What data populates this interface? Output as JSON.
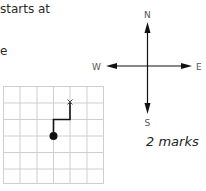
{
  "question": {
    "line1": "starts at",
    "line2": "e"
  },
  "compass": {
    "north": "N",
    "south": "S",
    "east": "E",
    "west": "W"
  },
  "grid": {
    "columns": 6,
    "rows": 6,
    "start_marker": "dot",
    "end_marker": "x",
    "end_label": "x",
    "path": [
      "up 1",
      "right 1",
      "up 1"
    ]
  },
  "marks": "2 marks",
  "colors": {
    "grid_line": "#cfcfcf",
    "path": "#111111",
    "text": "#2a2a2a"
  }
}
